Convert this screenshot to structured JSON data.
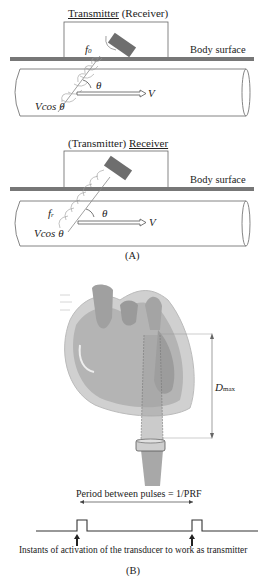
{
  "panel_a": {
    "top": {
      "title_underlined": "Transmitter",
      "title_rest": " (Receiver)",
      "freq_label": "f",
      "freq_sub": "0",
      "surface_label": "Body surface",
      "angle_label": "θ",
      "velocity_label": "V",
      "component_label": "Vcos θ"
    },
    "bottom": {
      "title_rest": "(Transmitter) ",
      "title_underlined": "Receiver",
      "freq_label": "f",
      "freq_sub": "r",
      "surface_label": "Body surface",
      "angle_label": "θ",
      "velocity_label": "V",
      "component_label": "Vcos θ"
    },
    "caption": "(A)"
  },
  "panel_b": {
    "depth_label": "D",
    "depth_sub": "max",
    "period_label": "Period between pulses = 1/PRF",
    "activation_label": "Instants of activation of the transducer to work as transmitter",
    "caption": "(B)"
  },
  "colors": {
    "line": "#555555",
    "transducer": "#6e6e6e",
    "heart_dark": "#9a9a9a",
    "heart_mid": "#b8b8b8",
    "heart_light": "#d6d6d6",
    "beam": "#a8a8a8"
  }
}
